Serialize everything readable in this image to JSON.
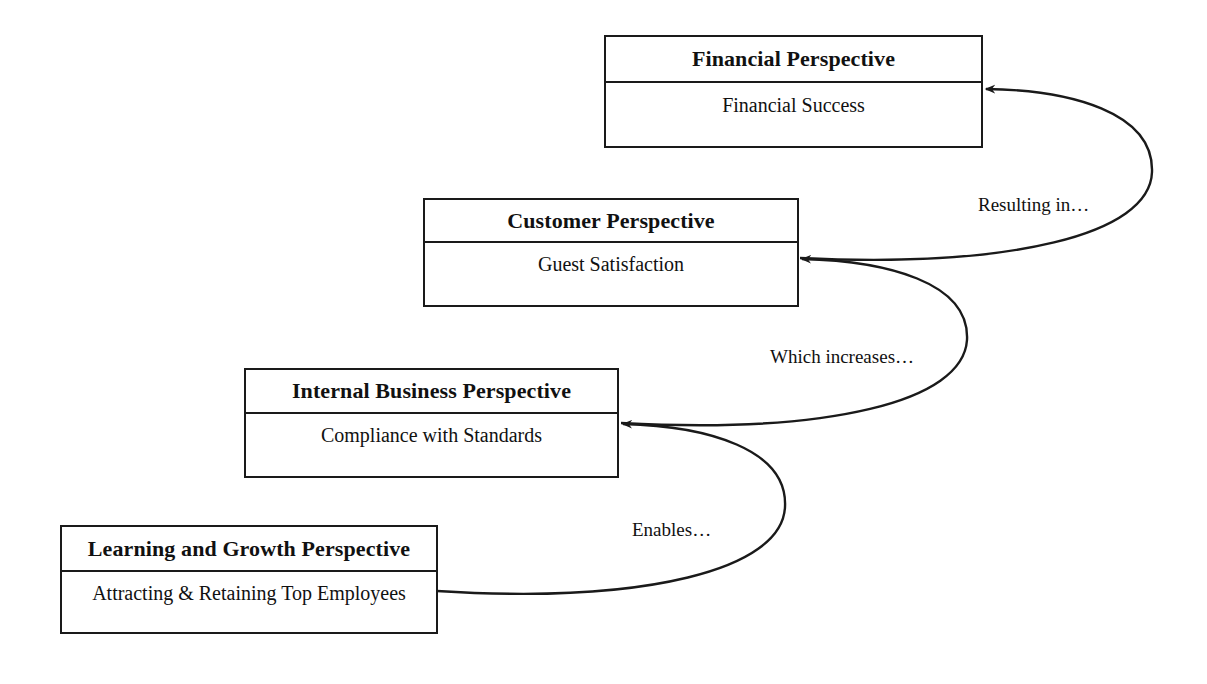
{
  "diagram": {
    "type": "strategy-map",
    "background_color": "#ffffff",
    "line_color": "#1a1a1a",
    "text_color": "#111111"
  },
  "boxes": [
    {
      "id": "financial",
      "title": "Financial Perspective",
      "measure": "Financial Success",
      "level": 4
    },
    {
      "id": "customer",
      "title": "Customer Perspective",
      "measure": "Guest Satisfaction",
      "level": 3
    },
    {
      "id": "internal",
      "title": "Internal Business Perspective",
      "measure": "Compliance with Standards",
      "level": 2
    },
    {
      "id": "learning",
      "title": "Learning and Growth Perspective",
      "measure": "Attracting & Retaining Top Employees",
      "level": 1
    }
  ],
  "connectors": [
    {
      "id": "customer-to-financial",
      "label": "Resulting in…",
      "from": "customer",
      "to": "financial",
      "arrowhead": true
    },
    {
      "id": "internal-to-customer",
      "label": "Which increases…",
      "from": "internal",
      "to": "customer",
      "arrowhead": true
    },
    {
      "id": "learning-to-internal",
      "label": "Enables…",
      "from": "learning",
      "to": "internal",
      "arrowhead": true
    }
  ]
}
